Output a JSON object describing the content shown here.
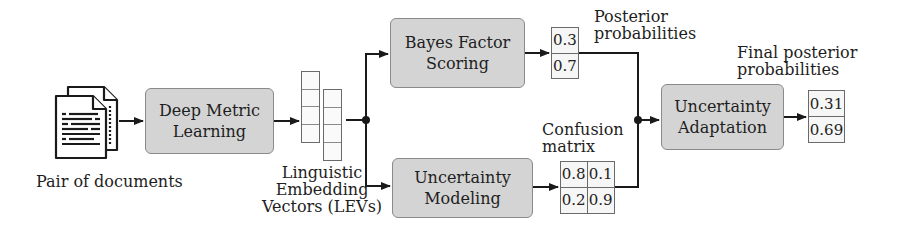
{
  "diagram": {
    "input": {
      "label": "Pair of documents",
      "icon": "documents-icon"
    },
    "nodes": {
      "deep_metric": {
        "line1": "Deep Metric",
        "line2": "Learning"
      },
      "bayes": {
        "line1": "Bayes Factor",
        "line2": "Scoring"
      },
      "unc_model": {
        "line1": "Uncertainty",
        "line2": "Modeling"
      },
      "unc_adapt": {
        "line1": "Uncertainty",
        "line2": "Adaptation"
      }
    },
    "levs": {
      "line1": "Linguistic",
      "line2": "Embedding",
      "line3": "Vectors (LEVs)"
    },
    "posterior": {
      "label1": "Posterior",
      "label2": "probabilities",
      "values": [
        "0.3",
        "0.7"
      ]
    },
    "confusion": {
      "label1": "Confusion",
      "label2": "matrix",
      "values": [
        "0.8",
        "0.1",
        "0.2",
        "0.9"
      ]
    },
    "final": {
      "label1": "Final posterior",
      "label2": "probabilities",
      "values": [
        "0.31",
        "0.69"
      ]
    },
    "colors": {
      "box_fill": "#d4d4d4",
      "box_border": "#8a8a8a",
      "line": "#1a1a1a"
    }
  }
}
